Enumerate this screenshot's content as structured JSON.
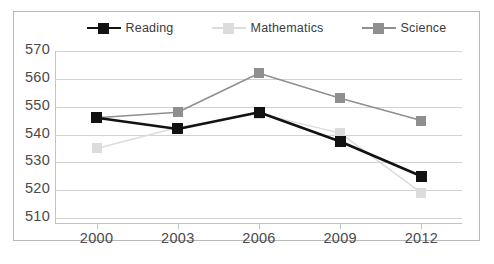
{
  "chart_data": {
    "type": "line",
    "title": "",
    "subtitle": "",
    "xlabel": "",
    "ylabel": "",
    "categories": [
      "2000",
      "2003",
      "2006",
      "2009",
      "2012"
    ],
    "x": [
      2000,
      2003,
      2006,
      2009,
      2012
    ],
    "ylim": [
      510,
      570
    ],
    "yticks": [
      510,
      520,
      530,
      540,
      550,
      560,
      570
    ],
    "ytick_labels": [
      "510",
      "520",
      "530",
      "540",
      "550",
      "560",
      "570"
    ],
    "grid": "horizontal",
    "legend_position": "top-center",
    "series": [
      {
        "name": "Reading",
        "color": "#121212",
        "marker": "square",
        "values": [
          546,
          542,
          548,
          537.5,
          525
        ]
      },
      {
        "name": "Mathematics",
        "color": "#dcdcdc",
        "marker": "square",
        "values": [
          535,
          542.5,
          547.5,
          540.5,
          519
        ]
      },
      {
        "name": "Science",
        "color": "#8f8f8f",
        "marker": "square",
        "values": [
          546,
          548,
          562,
          553,
          545
        ]
      }
    ]
  },
  "legend": {
    "items": [
      {
        "label": "Reading",
        "color": "#121212"
      },
      {
        "label": "Mathematics",
        "color": "#dcdcdc"
      },
      {
        "label": "Science",
        "color": "#8f8f8f"
      }
    ]
  },
  "axes": {
    "y_tick_labels": [
      "570",
      "560",
      "550",
      "540",
      "530",
      "520",
      "510"
    ],
    "x_tick_labels": [
      "2000",
      "2003",
      "2006",
      "2009",
      "2012"
    ]
  },
  "colors": {
    "frame_border": "#b9b9b9",
    "gridline": "#d2d2d2",
    "axis": "#c4c4c4",
    "tick_text": "#4a4a4a",
    "legend_text": "#3a3a3a",
    "background": "#ffffff"
  }
}
